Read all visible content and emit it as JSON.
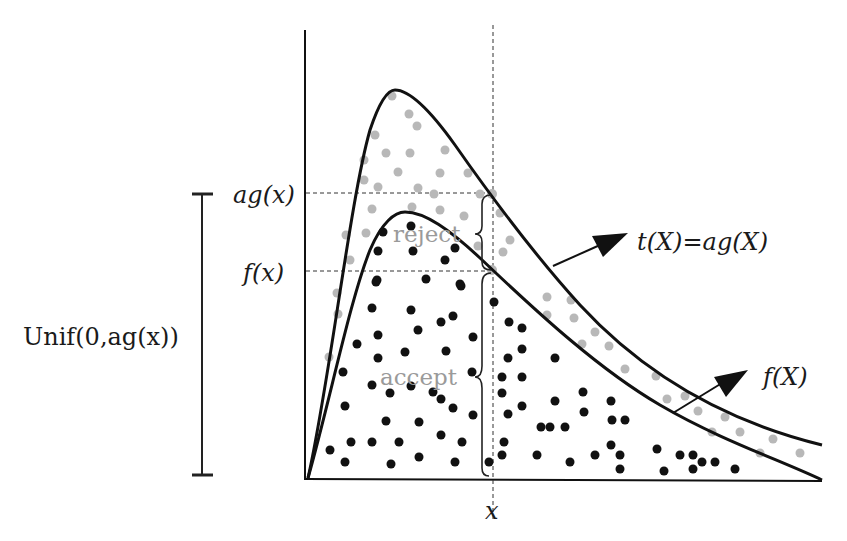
{
  "diagram": {
    "labels": {
      "ag_x": "ag(x)",
      "f_x": "f(x)",
      "unif": "Unif(0,ag(x))",
      "x": "x",
      "envelope": "t(X)=ag(X)",
      "target": "f(X)",
      "reject": "reject",
      "accept": "accept"
    },
    "colors": {
      "curve": "#111111",
      "accepted_point": "#111111",
      "rejected_point": "#b5b5b5",
      "region_label": "#9a9a9a"
    },
    "curves": [
      {
        "name": "envelope t(X)=ag(X)",
        "peak": [
          395,
          90
        ]
      },
      {
        "name": "target f(X)",
        "peak": [
          405,
          212
        ]
      }
    ],
    "markers": {
      "x_position": 493,
      "ag_x_level": 193,
      "f_x_level": 271,
      "axis_y": 479
    }
  }
}
